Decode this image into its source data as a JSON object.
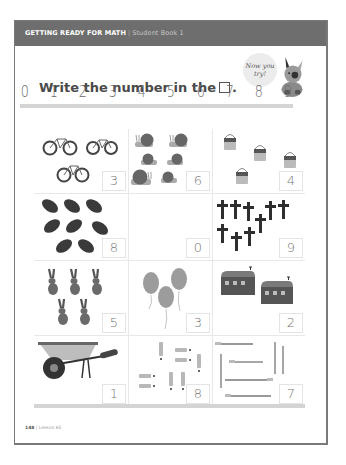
{
  "header": {
    "title": "GETTING READY FOR MATH",
    "separator": "|",
    "subtitle": "Student Book 1"
  },
  "mascot": {
    "bubble_line1": "Now you",
    "bubble_line2": "try!",
    "icon": "dog-mascot-icon"
  },
  "instruction": {
    "text": "Write the number in the",
    "box_symbol": "□",
    "end": "."
  },
  "number_line": [
    "0",
    "1",
    "2",
    "3",
    "4",
    "5",
    "6",
    "7",
    "8",
    "9"
  ],
  "cells": [
    {
      "item": "bicycle",
      "count": 3,
      "answer": "3"
    },
    {
      "item": "snail",
      "count": 6,
      "answer": "6"
    },
    {
      "item": "paint-can",
      "count": 4,
      "answer": "4",
      "label": "Paint"
    },
    {
      "item": "football",
      "count": 8,
      "answer": "8"
    },
    {
      "item": "empty",
      "count": 0,
      "answer": "0"
    },
    {
      "item": "cross",
      "count": 9,
      "answer": "9"
    },
    {
      "item": "rabbit",
      "count": 5,
      "answer": "5"
    },
    {
      "item": "balloon",
      "count": 3,
      "answer": "3"
    },
    {
      "item": "barn",
      "count": 2,
      "answer": "2"
    },
    {
      "item": "wheelbarrow",
      "count": 1,
      "answer": "1"
    },
    {
      "item": "marker",
      "count": 8,
      "answer": "8"
    },
    {
      "item": "paintbrush",
      "count": 7,
      "answer": "7"
    }
  ],
  "footer": {
    "page_number": "148",
    "separator": "|",
    "lesson": "Lesson 65"
  },
  "colors": {
    "header_bg": "#6e6e6e",
    "text_dark": "#4a4a4a",
    "guide_bar": "#d4d4d4"
  }
}
